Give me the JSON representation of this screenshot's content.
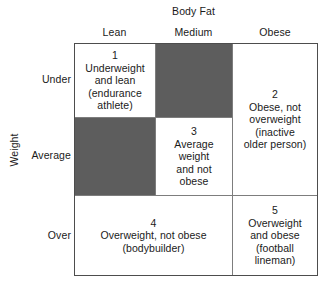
{
  "axes": {
    "column_axis_title": "Body Fat",
    "row_axis_title": "Weight",
    "column_headers": [
      "Lean",
      "Medium",
      "Obese"
    ],
    "row_headers": [
      "Under",
      "Average",
      "Over"
    ]
  },
  "colors": {
    "shaded_cell": "#5d5d5d",
    "border": "#4d4d4d",
    "gridline": "#7d7d7d",
    "background": "#ffffff",
    "text": "#1a1a1a"
  },
  "cells": [
    {
      "id": 1,
      "number": "1",
      "weight": "Under",
      "body_fat": "Lean",
      "text": "1\nUnderweight\nand lean\n(endurance\nathlete)",
      "shaded": false
    },
    {
      "id": 2,
      "number": "2",
      "weight": "Under / Average",
      "body_fat": "Obese",
      "text": "2\nObese, not\noverweight\n(inactive\nolder person)",
      "shaded": false
    },
    {
      "id": 3,
      "number": "3",
      "weight": "Average",
      "body_fat": "Medium",
      "text": "3\nAverage\nweight\nand not\nobese",
      "shaded": false
    },
    {
      "id": 4,
      "number": "4",
      "weight": "Over",
      "body_fat": "Lean / Medium",
      "text": "4\nOverweight, not obese\n(bodybuilder)",
      "shaded": false
    },
    {
      "id": 5,
      "number": "5",
      "weight": "Over",
      "body_fat": "Obese",
      "text": "5\nOverweight\nand obese\n(football\nlineman)",
      "shaded": false
    }
  ],
  "shaded_blocks": [
    {
      "weight": "Under",
      "body_fat": "Medium",
      "label": ""
    },
    {
      "weight": "Average",
      "body_fat": "Lean",
      "label": ""
    }
  ]
}
